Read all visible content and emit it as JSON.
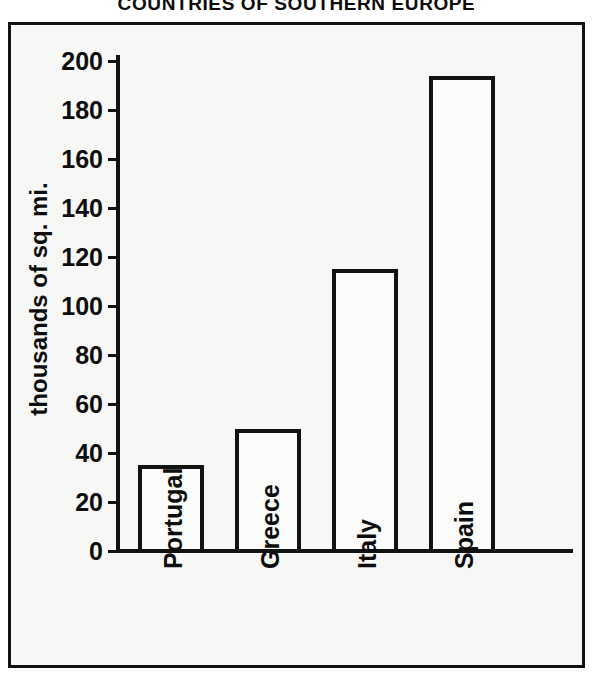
{
  "chart_data": {
    "type": "bar",
    "title": "COUNTRIES OF SOUTHERN EUROPE",
    "xlabel": "",
    "ylabel": "thousands of sq. mi.",
    "categories": [
      "Portugal",
      "Greece",
      "Italy",
      "Spain"
    ],
    "values": [
      35,
      50,
      115,
      194
    ],
    "ylim": [
      0,
      200
    ],
    "yticks": [
      0,
      20,
      40,
      60,
      80,
      100,
      120,
      140,
      160,
      180,
      200
    ],
    "ytick_labels": [
      "0",
      "20",
      "40",
      "60",
      "80",
      "100",
      "120",
      "140",
      "160",
      "180",
      "200"
    ],
    "grid": false,
    "legend": false,
    "bar_style": "hollow-outline",
    "colors": {
      "bar_fill": "#fbfbf9",
      "bar_outline": "#121212",
      "axis": "#121212",
      "text": "#0d0d0d",
      "plot_background": "#f7f7f5",
      "frame_border": "#121212"
    }
  }
}
